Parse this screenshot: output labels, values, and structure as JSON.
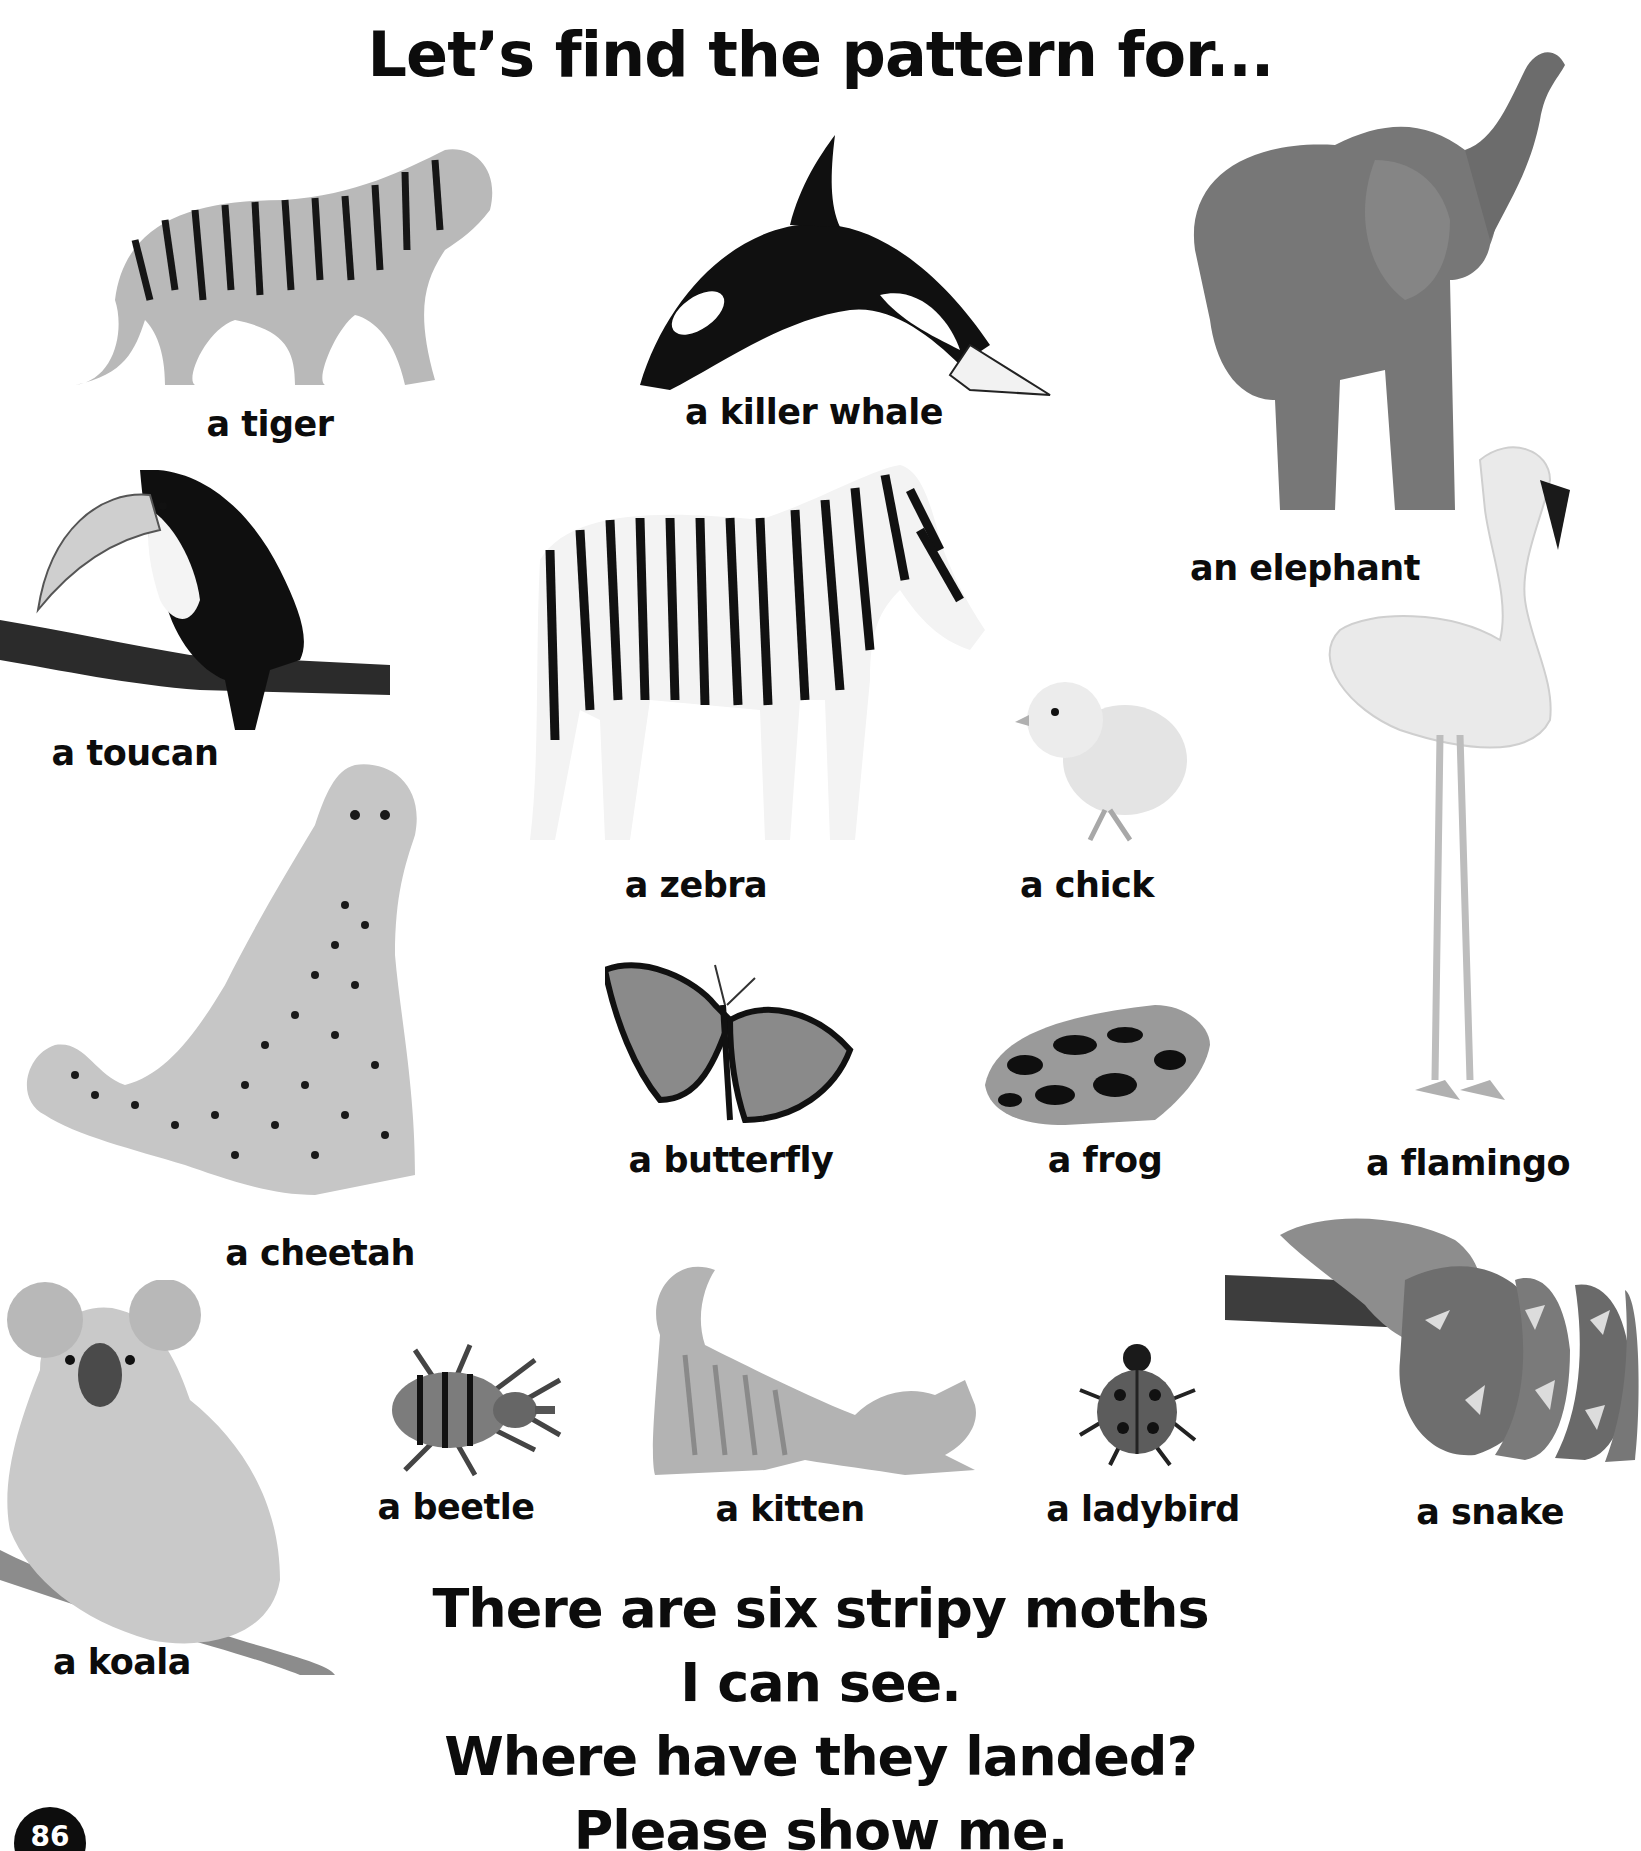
{
  "page": {
    "title": "Let’s find the pattern for...",
    "page_number": "86",
    "colors": {
      "background": "#ffffff",
      "text": "#0c0c0c",
      "page_badge": "#0d0d0d"
    }
  },
  "animals": [
    {
      "id": "tiger",
      "label": "a tiger"
    },
    {
      "id": "killer-whale",
      "label": "a killer whale"
    },
    {
      "id": "elephant",
      "label": "an elephant"
    },
    {
      "id": "toucan",
      "label": "a toucan"
    },
    {
      "id": "zebra",
      "label": "a zebra"
    },
    {
      "id": "chick",
      "label": "a chick"
    },
    {
      "id": "flamingo",
      "label": "a flamingo"
    },
    {
      "id": "cheetah",
      "label": "a cheetah"
    },
    {
      "id": "butterfly",
      "label": "a butterfly"
    },
    {
      "id": "frog",
      "label": "a frog"
    },
    {
      "id": "koala",
      "label": "a koala"
    },
    {
      "id": "beetle",
      "label": "a beetle"
    },
    {
      "id": "kitten",
      "label": "a kitten"
    },
    {
      "id": "ladybird",
      "label": "a ladybird"
    },
    {
      "id": "snake",
      "label": "a snake"
    }
  ],
  "rhyme": {
    "lines": [
      "There are six stripy moths",
      "I can see.",
      "Where have they landed?",
      "Please show me."
    ]
  }
}
